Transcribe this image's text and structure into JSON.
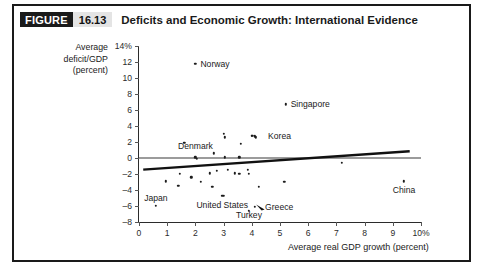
{
  "figure": {
    "badge_word": "FIGURE",
    "number": "16.13",
    "title": "Deficits and Economic Growth: International Evidence"
  },
  "chart_data": {
    "type": "scatter",
    "title": "Deficits and Economic Growth: International Evidence",
    "xlabel": "Average real GDP growth (percent)",
    "ylabel": "Average deficit/GDP (percent)",
    "xlim": [
      0,
      10
    ],
    "ylim": [
      -8,
      14
    ],
    "xticks": [
      "0",
      "1",
      "2",
      "3",
      "4",
      "5",
      "6",
      "7",
      "8",
      "9",
      "10%"
    ],
    "xtick_values": [
      0,
      1,
      2,
      3,
      4,
      5,
      6,
      7,
      8,
      9,
      10
    ],
    "yticks": [
      "14%",
      "12",
      "10",
      "8",
      "6",
      "4",
      "2",
      "0",
      "-2",
      "-4",
      "-6",
      "-8"
    ],
    "ytick_values": [
      14,
      12,
      10,
      8,
      6,
      4,
      2,
      0,
      -2,
      -4,
      -6,
      -8
    ],
    "grid": false,
    "legend": "none",
    "zero_line": true,
    "trendline": {
      "x0": 0.15,
      "y0": -1.45,
      "x1": 9.6,
      "y1": 0.85,
      "slope_note": "slightly upward sloping"
    },
    "labeled_points": [
      {
        "name": "Norway",
        "x": 2.0,
        "y": 11.8
      },
      {
        "name": "Singapore",
        "x": 5.2,
        "y": 6.7
      },
      {
        "name": "Denmark",
        "x": 2.0,
        "y": 0.1
      },
      {
        "name": "Korea",
        "x": 4.1,
        "y": 2.7
      },
      {
        "name": "China",
        "x": 9.4,
        "y": -2.9
      },
      {
        "name": "Japan",
        "x": 0.6,
        "y": -6.0
      },
      {
        "name": "United States",
        "x": 3.0,
        "y": -4.7
      },
      {
        "name": "Greece",
        "x": 4.1,
        "y": -6.1
      },
      {
        "name": "Turkey",
        "x": 3.9,
        "y": -6.6
      }
    ],
    "unlabeled_points": [
      {
        "x": 1.6,
        "y": 1.9
      },
      {
        "x": 2.05,
        "y": -0.1
      },
      {
        "x": 2.65,
        "y": 0.6
      },
      {
        "x": 3.05,
        "y": 2.6
      },
      {
        "x": 3.0,
        "y": 3.0
      },
      {
        "x": 3.05,
        "y": 0.1
      },
      {
        "x": 3.6,
        "y": 1.8
      },
      {
        "x": 3.55,
        "y": 0.1
      },
      {
        "x": 4.0,
        "y": 2.75
      },
      {
        "x": 4.15,
        "y": 2.6
      },
      {
        "x": 7.2,
        "y": -0.6
      },
      {
        "x": 0.95,
        "y": -2.9
      },
      {
        "x": 1.4,
        "y": -3.5
      },
      {
        "x": 1.45,
        "y": -2.0
      },
      {
        "x": 2.2,
        "y": -2.95
      },
      {
        "x": 2.5,
        "y": -1.9
      },
      {
        "x": 2.75,
        "y": -1.6
      },
      {
        "x": 2.6,
        "y": -3.6
      },
      {
        "x": 3.15,
        "y": -1.5
      },
      {
        "x": 3.4,
        "y": -1.9
      },
      {
        "x": 3.55,
        "y": -2.0
      },
      {
        "x": 3.85,
        "y": -1.5
      },
      {
        "x": 3.9,
        "y": -2.0
      },
      {
        "x": 4.25,
        "y": -3.6
      },
      {
        "x": 5.15,
        "y": -3.0
      },
      {
        "x": 2.95,
        "y": -4.7
      },
      {
        "x": 1.85,
        "y": -2.4
      }
    ],
    "annotations": [
      {
        "text": "Norway",
        "x": 2.0,
        "y": 11.8,
        "anchor": "right-of-point"
      },
      {
        "text": "Singapore",
        "x": 5.2,
        "y": 6.7,
        "anchor": "right-of-point"
      },
      {
        "text": "Denmark",
        "x": 2.0,
        "y": 1.5,
        "anchor": "above-point"
      },
      {
        "text": "Korea",
        "x": 4.4,
        "y": 2.7,
        "anchor": "right-of-point"
      },
      {
        "text": "China",
        "x": 9.4,
        "y": -4.0,
        "anchor": "below-point"
      },
      {
        "text": "Japan",
        "x": 0.6,
        "y": -5.0,
        "anchor": "above-point"
      },
      {
        "text": "United States",
        "x": 2.95,
        "y": -5.9,
        "anchor": "below-point"
      },
      {
        "text": "Greece",
        "x": 4.4,
        "y": -6.1,
        "anchor": "right-of-arrow"
      },
      {
        "text": "Turkey",
        "x": 3.9,
        "y": -7.1,
        "anchor": "below-point"
      }
    ]
  }
}
